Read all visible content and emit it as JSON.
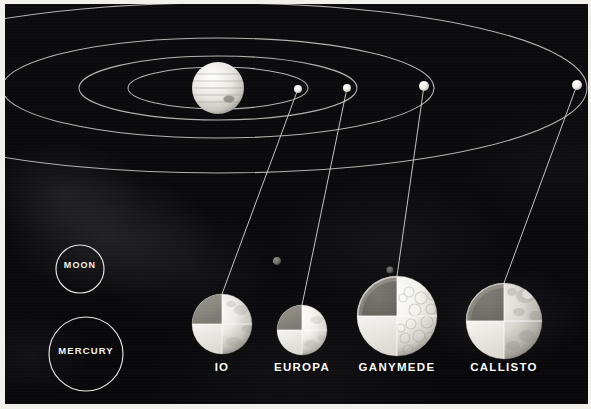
{
  "figure": {
    "type": "astronomy-diagram",
    "background_color": "#0a0a0c",
    "line_color": "#d9d9d4",
    "text_color": "#fbfbfa"
  },
  "orbit_system": {
    "primary": {
      "name": "Jupiter",
      "cx": 213,
      "cy": 84,
      "r": 26
    },
    "orbits": [
      {
        "name": "Io orbit",
        "rx": 90,
        "ry": 21
      },
      {
        "name": "Europa orbit",
        "rx": 139,
        "ry": 32
      },
      {
        "name": "Ganymede orbit",
        "rx": 216,
        "ry": 50
      },
      {
        "name": "Callisto orbit",
        "rx": 369,
        "ry": 85
      }
    ],
    "orbit_dots": [
      {
        "name": "Io dot",
        "cx": 293,
        "cy": 85,
        "r": 4.0
      },
      {
        "name": "Europa dot",
        "cx": 342,
        "cy": 84,
        "r": 4.0
      },
      {
        "name": "Ganymede dot",
        "cx": 419,
        "cy": 82,
        "r": 5.0
      },
      {
        "name": "Callisto dot",
        "cx": 572,
        "cy": 81,
        "r": 5.0
      }
    ]
  },
  "reference_circles": [
    {
      "label": "MOON",
      "cx": 75,
      "cy": 265,
      "r": 24
    },
    {
      "label": "MERCURY",
      "cx": 81,
      "cy": 350,
      "r": 37
    }
  ],
  "moons": [
    {
      "label": "IO",
      "cx": 217,
      "cy": 320,
      "r": 30,
      "caption_x": 217,
      "caption_y": 364
    },
    {
      "label": "EUROPA",
      "cx": 297,
      "cy": 326,
      "r": 25,
      "caption_x": 297,
      "caption_y": 364
    },
    {
      "label": "GANYMEDE",
      "cx": 392,
      "cy": 312,
      "r": 40,
      "caption_x": 392,
      "caption_y": 364
    },
    {
      "label": "CALLISTO",
      "cx": 499,
      "cy": 317,
      "r": 38,
      "caption_x": 499,
      "caption_y": 364
    }
  ],
  "leader_lines": [
    {
      "name": "io-leader",
      "x1": 293,
      "y1": 85,
      "x2": 217,
      "y2": 290
    },
    {
      "name": "europa-leader",
      "x1": 342,
      "y1": 84,
      "x2": 297,
      "y2": 301
    },
    {
      "name": "ganymede-leader",
      "x1": 419,
      "y1": 82,
      "x2": 392,
      "y2": 272
    },
    {
      "name": "callisto-leader",
      "x1": 572,
      "y1": 81,
      "x2": 499,
      "y2": 279
    }
  ],
  "background_dots": [
    {
      "name": "distant-moon-1",
      "cx": 272,
      "cy": 257,
      "r": 4.0
    },
    {
      "name": "distant-moon-2",
      "cx": 385,
      "cy": 266,
      "r": 3.5
    }
  ]
}
